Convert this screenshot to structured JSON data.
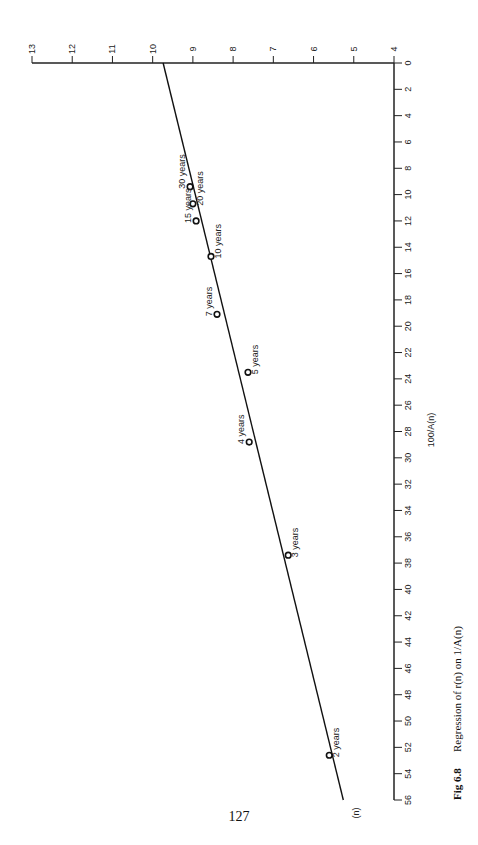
{
  "page": {
    "number": "127"
  },
  "caption": {
    "fig": "Fig 6.8",
    "text": "Regression of r(n) on 1/A(n)"
  },
  "chart_data": {
    "type": "scatter",
    "title": "Regression of r(n) on 1/A(n)",
    "orientation": "rotated 90° clockwise (x axis runs vertically down the page, y axis runs horizontally along the top)",
    "xlabel": "100/A(n)",
    "ylabel": "r(n)",
    "xlim": [
      0,
      56
    ],
    "ylim": [
      4,
      13
    ],
    "x_ticks": [
      0,
      2,
      4,
      6,
      8,
      10,
      12,
      14,
      16,
      18,
      20,
      22,
      24,
      26,
      28,
      30,
      32,
      34,
      36,
      38,
      40,
      42,
      44,
      46,
      48,
      50,
      52,
      54,
      56
    ],
    "y_ticks": [
      4,
      5,
      6,
      7,
      8,
      9,
      10,
      11,
      12,
      13
    ],
    "grid": false,
    "points": [
      {
        "label": "30 years",
        "x": 9.4,
        "y": 9.07
      },
      {
        "label": "20 years",
        "x": 10.7,
        "y": 9.0
      },
      {
        "label": "15 years",
        "x": 12.0,
        "y": 8.92
      },
      {
        "label": "10 years",
        "x": 14.7,
        "y": 8.55
      },
      {
        "label": "7 years",
        "x": 19.1,
        "y": 8.4
      },
      {
        "label": "5 years",
        "x": 23.5,
        "y": 7.63
      },
      {
        "label": "4 years",
        "x": 28.8,
        "y": 7.6
      },
      {
        "label": "3 years",
        "x": 37.4,
        "y": 6.63
      },
      {
        "label": "2 years",
        "x": 52.6,
        "y": 5.61
      }
    ],
    "regression_line": {
      "x": [
        0,
        56
      ],
      "y": [
        9.74,
        5.26
      ]
    },
    "line_end_label": "(n)"
  }
}
